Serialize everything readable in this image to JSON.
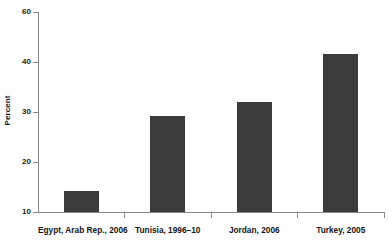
{
  "chart_data": {
    "type": "bar",
    "title": "",
    "subtitle": "",
    "xlabel": "",
    "ylabel": "Percent",
    "categories": [
      "Egypt, Arab Rep., 2006",
      "Tunisia, 1996–10",
      "Jordan, 2006",
      "Turkey, 2005"
    ],
    "values": [
      14.2,
      29.3,
      32.0,
      41.6
    ],
    "ylim": [
      10,
      60
    ],
    "y_ticks": [
      10,
      20,
      30,
      40,
      60
    ],
    "y_tick_labels": [
      "10",
      "20",
      "30",
      "40",
      "60"
    ],
    "grid": false,
    "legend": false,
    "bar_color": "#3b3b3b",
    "axis_color": "#8a8a8a",
    "text_color": "#1b1b1b"
  },
  "axes": {
    "y_title": "Percent",
    "y_tick_labels": [
      "60",
      "40",
      "30",
      "20",
      "10"
    ]
  },
  "bars": [
    {
      "label": "Egypt, Arab Rep., 2006",
      "value": "14.2"
    },
    {
      "label": "Tunisia, 1996–10",
      "value": "29.3"
    },
    {
      "label": "Jordan, 2006",
      "value": "32.0"
    },
    {
      "label": "Turkey, 2005",
      "value": "41.6"
    }
  ]
}
